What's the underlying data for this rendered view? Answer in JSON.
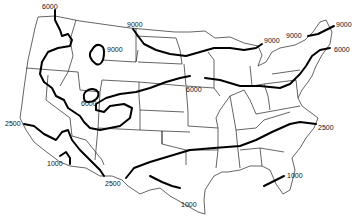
{
  "map": {
    "subject": "United States contour map",
    "colors": {
      "background": "#ffffff",
      "lines": "#000000",
      "borders": "#222222"
    },
    "contour_labels": [
      {
        "id": "nw-6000",
        "text": "6000",
        "x": 42,
        "y": 6
      },
      {
        "id": "mt-9000",
        "text": "9000",
        "x": 128,
        "y": 23
      },
      {
        "id": "wy-9000",
        "text": "9000",
        "x": 107,
        "y": 48
      },
      {
        "id": "co-6000",
        "text": "6000",
        "x": 82,
        "y": 100
      },
      {
        "id": "mi-9000",
        "text": "9000",
        "x": 264,
        "y": 39
      },
      {
        "id": "ne-9000-left",
        "text": "9000",
        "x": 285,
        "y": 33
      },
      {
        "id": "ne-9000-right",
        "text": "9000",
        "x": 337,
        "y": 22
      },
      {
        "id": "ne-6000",
        "text": "6000",
        "x": 335,
        "y": 46
      },
      {
        "id": "ia-6000",
        "text": "6000",
        "x": 186,
        "y": 88
      },
      {
        "id": "ca-2500",
        "text": "2500",
        "x": 5,
        "y": 120
      },
      {
        "id": "ca-1000",
        "text": "1000",
        "x": 47,
        "y": 160
      },
      {
        "id": "tx-2500",
        "text": "2500",
        "x": 106,
        "y": 181
      },
      {
        "id": "va-2500",
        "text": "2500",
        "x": 318,
        "y": 124
      },
      {
        "id": "fl-1000",
        "text": "1000",
        "x": 288,
        "y": 172
      },
      {
        "id": "tx-1000",
        "text": "1000",
        "x": 181,
        "y": 202
      }
    ]
  }
}
